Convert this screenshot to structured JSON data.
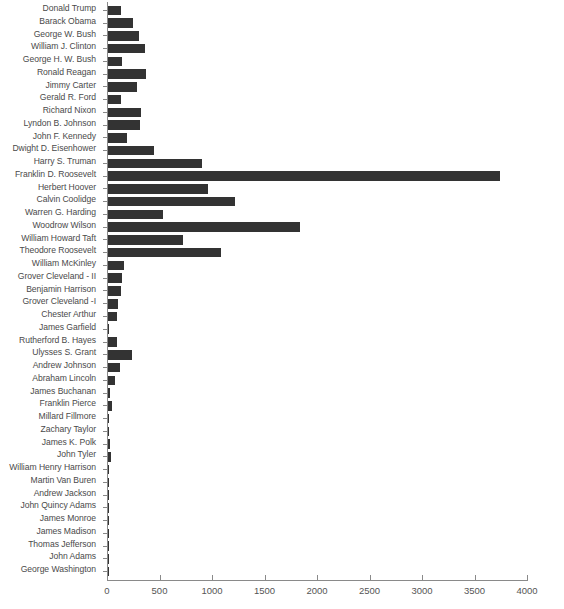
{
  "chart_data": {
    "type": "bar",
    "orientation": "horizontal",
    "title": "",
    "subtitle": "",
    "xlabel": "",
    "ylabel": "",
    "xlim": [
      0,
      4000
    ],
    "ylim": null,
    "grid": false,
    "legend": null,
    "bar_color": "#333333",
    "axis_color": "#8a8a8a",
    "xticks": [
      0,
      500,
      1000,
      1500,
      2000,
      2500,
      3000,
      3500,
      4000
    ],
    "xtick_labels": [
      "0",
      "500",
      "1000",
      "1500",
      "2000",
      "2500",
      "3000",
      "3500",
      "4000"
    ],
    "categories": [
      "Donald Trump",
      "Barack Obama",
      "George W. Bush",
      "William J. Clinton",
      "George H. W. Bush",
      "Ronald Reagan",
      "Jimmy Carter",
      "Gerald R. Ford",
      "Richard Nixon",
      "Lyndon B. Johnson",
      "John F. Kennedy",
      "Dwight D. Eisenhower",
      "Harry S. Truman",
      "Franklin D. Roosevelt",
      "Herbert Hoover",
      "Calvin Coolidge",
      "Warren G. Harding",
      "Woodrow Wilson",
      "William Howard Taft",
      "Theodore Roosevelt",
      "William McKinley",
      "Grover Cleveland - II",
      "Benjamin Harrison",
      "Grover Cleveland -I",
      "Chester Arthur",
      "James Garfield",
      "Rutherford B. Hayes",
      "Ulysses S. Grant",
      "Andrew Johnson",
      "Abraham Lincoln",
      "James Buchanan",
      "Franklin Pierce",
      "Millard Fillmore",
      "Zachary Taylor",
      "James K. Polk",
      "John Tyler",
      "William Henry Harrison",
      "Martin Van Buren",
      "Andrew Jackson",
      "John Quincy Adams",
      "James Monroe",
      "James Madison",
      "Thomas Jefferson",
      "John Adams",
      "George Washington"
    ],
    "values": [
      133,
      248,
      300,
      360,
      142,
      370,
      290,
      135,
      320,
      310,
      195,
      450,
      905,
      3740,
      960,
      1215,
      530,
      1835,
      720,
      1090,
      160,
      145,
      130,
      105,
      95,
      20,
      95,
      240,
      120,
      75,
      25,
      50,
      20,
      20,
      30,
      35,
      10,
      15,
      20,
      10,
      5,
      5,
      5,
      5,
      5
    ]
  }
}
